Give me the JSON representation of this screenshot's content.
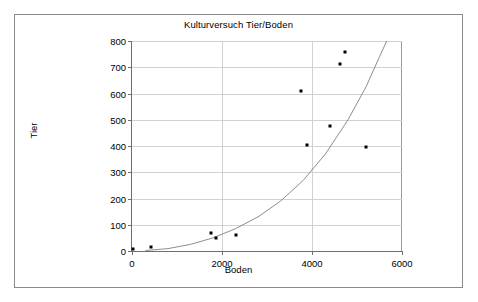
{
  "chart_data": {
    "type": "scatter",
    "title": "Kulturversuch Tier/Boden",
    "xlabel": "Boden",
    "ylabel": "Tier",
    "xlim": [
      0,
      6000
    ],
    "ylim": [
      0,
      800
    ],
    "xticks": [
      0,
      2000,
      4000,
      6000
    ],
    "yticks": [
      0,
      100,
      200,
      300,
      400,
      500,
      600,
      700,
      800
    ],
    "grid": true,
    "legend": "none",
    "series": [
      {
        "name": "Messpunkte",
        "marker": "square",
        "color": "#000000",
        "points": [
          {
            "x": 20,
            "y": 8
          },
          {
            "x": 420,
            "y": 15
          },
          {
            "x": 1760,
            "y": 68
          },
          {
            "x": 1860,
            "y": 48
          },
          {
            "x": 2320,
            "y": 60
          },
          {
            "x": 3760,
            "y": 610
          },
          {
            "x": 3880,
            "y": 405
          },
          {
            "x": 4400,
            "y": 478
          },
          {
            "x": 4620,
            "y": 712
          },
          {
            "x": 4740,
            "y": 758
          },
          {
            "x": 5190,
            "y": 396
          }
        ]
      },
      {
        "name": "Trendlinie",
        "marker": "none",
        "color": "#808080",
        "points": [
          {
            "x": 300,
            "y": 2
          },
          {
            "x": 800,
            "y": 9
          },
          {
            "x": 1300,
            "y": 25
          },
          {
            "x": 1800,
            "y": 50
          },
          {
            "x": 2300,
            "y": 85
          },
          {
            "x": 2800,
            "y": 130
          },
          {
            "x": 3300,
            "y": 190
          },
          {
            "x": 3800,
            "y": 268
          },
          {
            "x": 4300,
            "y": 370
          },
          {
            "x": 4800,
            "y": 500
          },
          {
            "x": 5200,
            "y": 625
          },
          {
            "x": 5500,
            "y": 740
          },
          {
            "x": 5660,
            "y": 800
          }
        ]
      }
    ]
  }
}
